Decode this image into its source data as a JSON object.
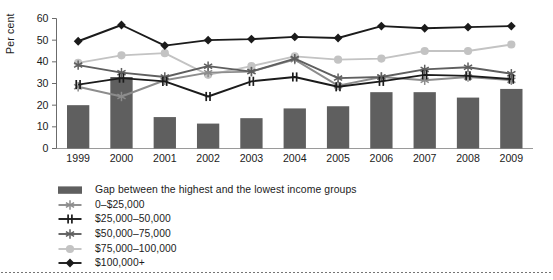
{
  "chart_data": {
    "type": "bar",
    "title": "",
    "xlabel": "",
    "ylabel": "Per cent",
    "categories": [
      "1999",
      "2000",
      "2001",
      "2002",
      "2003",
      "2004",
      "2005",
      "2006",
      "2007",
      "2008",
      "2009"
    ],
    "ylim": [
      0,
      60
    ],
    "yticks": [
      0,
      10,
      20,
      30,
      40,
      50,
      60
    ],
    "ytick_labels": [
      "0",
      "10",
      "20",
      "30",
      "40",
      "50",
      "60"
    ],
    "grid": false,
    "legend_position": "below",
    "bar_series": {
      "name": "Gap between the highest and the lowest income groups",
      "color": "#5f5f5f",
      "marker": "square",
      "values": [
        20,
        33,
        14.5,
        11.5,
        14,
        18.5,
        19.5,
        26,
        26,
        23.5,
        27.5
      ]
    },
    "series": [
      {
        "name": "0–$25,000",
        "color": "#8d8d8d",
        "marker": "star",
        "values": [
          28.5,
          24,
          31.5,
          35,
          35.5,
          41,
          29,
          33,
          31.5,
          33,
          31.5
        ]
      },
      {
        "name": "$25,000–50,000",
        "color": "#1b1b1b",
        "marker": "plus-bar",
        "values": [
          29.5,
          32.5,
          31,
          24,
          31,
          33,
          28.5,
          31,
          34,
          33.5,
          32
        ]
      },
      {
        "name": "$50,000–75,000",
        "color": "#5f5f5f",
        "marker": "asterisk",
        "values": [
          38.5,
          35,
          33,
          38,
          35.5,
          41.5,
          32.5,
          33,
          36.5,
          37.5,
          34.5
        ]
      },
      {
        "name": "$75,000–100,000",
        "color": "#c3c3c3",
        "marker": "circle",
        "values": [
          39.5,
          43,
          44,
          34,
          38,
          42.5,
          41,
          41.5,
          45,
          45,
          48
        ]
      },
      {
        "name": "$100,000+",
        "color": "#1b1b1b",
        "marker": "diamond",
        "values": [
          49.5,
          57,
          47.5,
          50,
          50.5,
          51.5,
          51,
          56.5,
          55.5,
          56,
          56.5
        ]
      }
    ]
  },
  "legend": {
    "items": [
      {
        "label": "Gap between the highest and the lowest income groups",
        "marker": "square",
        "color": "#5f5f5f"
      },
      {
        "label": "0–$25,000",
        "marker": "star",
        "color": "#8d8d8d"
      },
      {
        "label": "$25,000–50,000",
        "marker": "plus-bar",
        "color": "#1b1b1b"
      },
      {
        "label": "$50,000–75,000",
        "marker": "asterisk",
        "color": "#5f5f5f"
      },
      {
        "label": "$75,000–100,000",
        "marker": "circle",
        "color": "#c3c3c3"
      },
      {
        "label": "$100,000+",
        "marker": "diamond",
        "color": "#1b1b1b"
      }
    ]
  }
}
